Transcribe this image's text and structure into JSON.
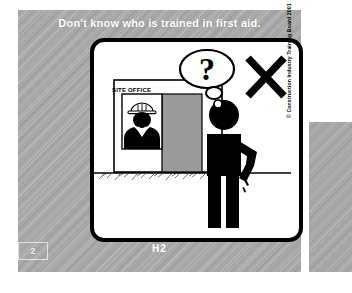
{
  "page": {
    "caption": "Don't know who is trained in first aid.",
    "code_label": "H2",
    "page_number": "2",
    "copyright": "© Construction Industry Training Board 2001"
  },
  "illustration": {
    "sign_text": "SITE OFFICE",
    "thought_bubble_text": "?",
    "cross_mark": "X",
    "elements": {
      "site_office_building": "site-office-building",
      "window": "office-window",
      "door": "office-door",
      "office_worker": "office-worker-with-hard-hat",
      "standing_figure": "standing-worker-figure",
      "ground_line": "ground-line",
      "thought_bubble": "thought-bubble"
    }
  },
  "colors": {
    "background_gray": "#a8a8a8",
    "card_white": "#ffffff",
    "ink_black": "#000000",
    "door_gray": "#9a9a9a",
    "caption_white": "#ffffff"
  }
}
